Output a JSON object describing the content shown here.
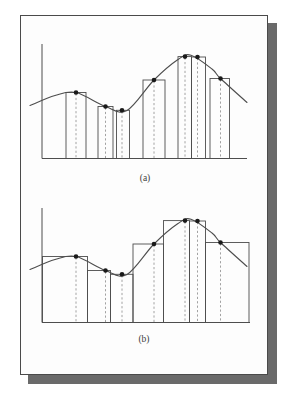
{
  "figure": {
    "colors": {
      "background": "#ffffff",
      "card_background": "#fdfdfd",
      "card_border": "#4a4a4a",
      "shadow": "#6a6a6a",
      "line": "#4d4d4d",
      "dashed": "#8a8a8a",
      "dot": "#1a1a1a"
    },
    "panels": [
      {
        "label": "(a)",
        "label_pos": {
          "x": 145,
          "y": 181
        },
        "axis": {
          "x": 42,
          "y_top": 44,
          "y_base": 158.5,
          "x_right": 247
        },
        "curve": [
          [
            30,
            105.5
          ],
          [
            55,
            95.5
          ],
          [
            76,
            92.5
          ],
          [
            105.5,
            106.5
          ],
          [
            127,
            110.5
          ],
          [
            154,
            80
          ],
          [
            178,
            59.5
          ],
          [
            191,
            55.2
          ],
          [
            212,
            69
          ],
          [
            220.5,
            78.5
          ],
          [
            247,
            102.5
          ]
        ],
        "rects": [
          {
            "x1": 66,
            "x2": 86,
            "sample": 76,
            "top": 92.5
          },
          {
            "x1": 98,
            "x2": 113,
            "sample": 105.5,
            "top": 106.5
          },
          {
            "x1": 116.5,
            "x2": 129.5,
            "sample": 122,
            "top": 110.3
          },
          {
            "x1": 143,
            "x2": 165,
            "sample": 154,
            "top": 80
          },
          {
            "x1": 178,
            "x2": 191.5,
            "sample": 185,
            "top": 56.6
          },
          {
            "x1": 191.5,
            "x2": 205.5,
            "sample": 197.5,
            "top": 57
          },
          {
            "x1": 210,
            "x2": 229.5,
            "sample": 220.5,
            "top": 78.5
          }
        ]
      },
      {
        "label": "(b)",
        "label_pos": {
          "x": 144,
          "y": 342
        },
        "axis": {
          "x": 42,
          "y_top": 208,
          "y_base": 322.5,
          "x_right": 250
        },
        "curve": [
          [
            30,
            269.5
          ],
          [
            55,
            259.5
          ],
          [
            76,
            256.5
          ],
          [
            105.5,
            270.5
          ],
          [
            127,
            274.5
          ],
          [
            154,
            244
          ],
          [
            178,
            223.5
          ],
          [
            191,
            219.2
          ],
          [
            212,
            233
          ],
          [
            220.5,
            242.5
          ],
          [
            247,
            266.5
          ]
        ],
        "rects": [
          {
            "x1": 42.5,
            "x2": 87.5,
            "sample": 76,
            "top": 256.5
          },
          {
            "x1": 87.5,
            "x2": 110.5,
            "sample": 105.5,
            "top": 270.5
          },
          {
            "x1": 110.5,
            "x2": 133,
            "sample": 122,
            "top": 274.3
          },
          {
            "x1": 133,
            "x2": 163.5,
            "sample": 154,
            "top": 244
          },
          {
            "x1": 163.5,
            "x2": 189.5,
            "sample": 185,
            "top": 220.6
          },
          {
            "x1": 189.5,
            "x2": 205.5,
            "sample": 197.5,
            "top": 221
          },
          {
            "x1": 205.5,
            "x2": 249,
            "sample": 220.5,
            "top": 242.5
          }
        ]
      }
    ]
  }
}
